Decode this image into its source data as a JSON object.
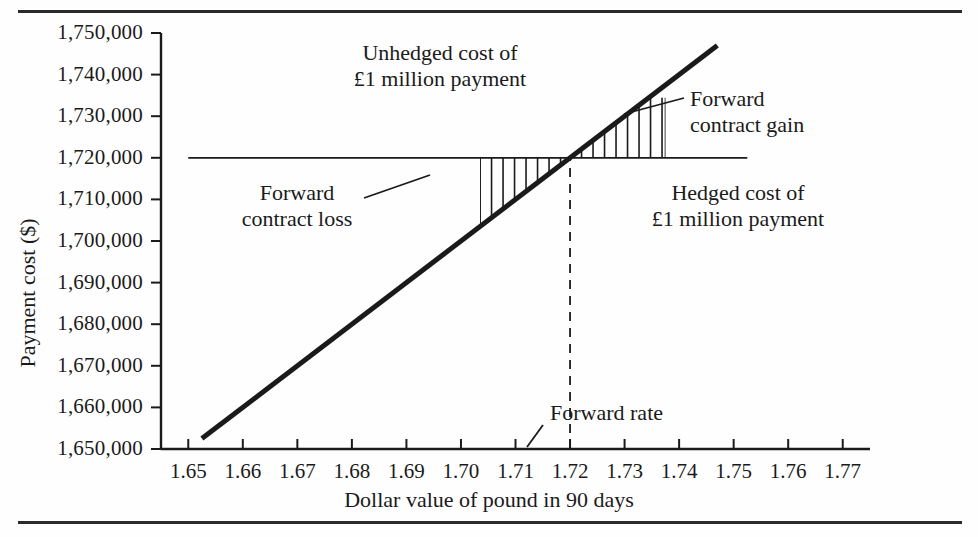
{
  "chart_data": {
    "type": "line",
    "title": "",
    "xlabel": "Dollar value of pound in 90 days",
    "ylabel": "Payment cost ($)",
    "xlim": [
      1.645,
      1.775
    ],
    "ylim": [
      1650000,
      1750000
    ],
    "grid": false,
    "legend_position": "none",
    "x_ticks": [
      "1.65",
      "1.66",
      "1.67",
      "1.68",
      "1.69",
      "1.70",
      "1.71",
      "1.72",
      "1.73",
      "1.74",
      "1.75",
      "1.76",
      "1.77"
    ],
    "x_tick_values": [
      1.65,
      1.66,
      1.67,
      1.68,
      1.69,
      1.7,
      1.71,
      1.72,
      1.73,
      1.74,
      1.75,
      1.76,
      1.77
    ],
    "y_ticks": [
      "1,650,000",
      "1,660,000",
      "1,670,000",
      "1,680,000",
      "1,690,000",
      "1,700,000",
      "1,710,000",
      "1,720,000",
      "1,730,000",
      "1,740,000",
      "1,750,000"
    ],
    "y_tick_values": [
      1650000,
      1660000,
      1670000,
      1680000,
      1690000,
      1700000,
      1710000,
      1720000,
      1730000,
      1740000,
      1750000
    ],
    "series": [
      {
        "name": "Unhedged cost of £1 million payment",
        "type": "line",
        "x": [
          1.6525,
          1.747
        ],
        "values": [
          1652500,
          1747000
        ],
        "style": "solid-thick"
      },
      {
        "name": "Hedged cost of £1 million payment",
        "type": "line",
        "x": [
          1.65,
          1.7525
        ],
        "values": [
          1720000,
          1720000
        ],
        "style": "solid-thin"
      },
      {
        "name": "Forward rate",
        "type": "vline",
        "x": [
          1.72,
          1.72
        ],
        "values": [
          1650000,
          1720000
        ],
        "style": "dashed"
      }
    ],
    "intersection": {
      "x": 1.72,
      "y": 1720000
    },
    "shaded_regions": [
      {
        "name": "Forward contract loss",
        "x_start": 1.7035,
        "x_end": 1.72,
        "hatch": "vertical"
      },
      {
        "name": "Forward contract gain",
        "x_start": 1.72,
        "x_end": 1.7375,
        "hatch": "vertical"
      }
    ],
    "annotations": [
      {
        "name": "unhedged-cost",
        "lines": [
          "Unhedged cost of",
          "£1 million payment"
        ]
      },
      {
        "name": "forward-contract-gain",
        "lines": [
          "Forward",
          "contract gain"
        ]
      },
      {
        "name": "forward-contract-loss",
        "lines": [
          "Forward",
          "contract loss"
        ]
      },
      {
        "name": "hedged-cost",
        "lines": [
          "Hedged cost of",
          "£1 million payment"
        ]
      },
      {
        "name": "forward-rate",
        "lines": [
          "Forward rate"
        ]
      }
    ]
  },
  "axes": {
    "y_title": "Payment cost ($)",
    "x_title": "Dollar value of pound in 90 days",
    "y_tick_labels": [
      "1,750,000",
      "1,740,000",
      "1,730,000",
      "1,720,000",
      "1,710,000",
      "1,700,000",
      "1,690,000",
      "1,680,000",
      "1,670,000",
      "1,660,000",
      "1,650,000"
    ],
    "x_tick_labels": [
      "1.65",
      "1.66",
      "1.67",
      "1.68",
      "1.69",
      "1.70",
      "1.71",
      "1.72",
      "1.73",
      "1.74",
      "1.75",
      "1.76",
      "1.77"
    ]
  },
  "annotations": {
    "unhedged_line1": "Unhedged cost of",
    "unhedged_line2": "£1 million payment",
    "gain_line1": "Forward",
    "gain_line2": "contract gain",
    "loss_line1": "Forward",
    "loss_line2": "contract loss",
    "hedged_line1": "Hedged cost of",
    "hedged_line2": "£1 million payment",
    "forward_rate": "Forward rate"
  },
  "colors": {
    "ink": "#1a1a1a",
    "rule": "#2b2b2b",
    "background": "#fefefe"
  }
}
